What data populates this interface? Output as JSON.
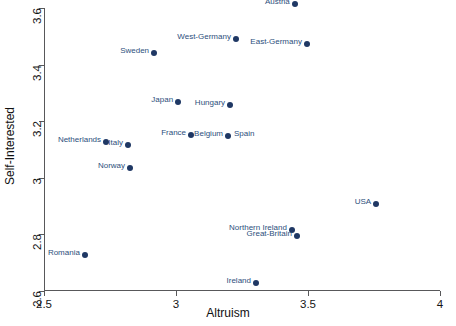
{
  "chart_data": {
    "type": "scatter",
    "title": "",
    "xlabel": "Altruism",
    "ylabel": "Self-Interested",
    "xlim": [
      2.5,
      4.0
    ],
    "ylim": [
      2.6,
      3.6
    ],
    "xticks": [
      "2.5",
      "3",
      "3.5",
      "4"
    ],
    "xtick_values": [
      2.5,
      3,
      3.5,
      4
    ],
    "yticks": [
      "2.6",
      "2.8",
      "3",
      "3.2",
      "3.4",
      "3.6"
    ],
    "ytick_values": [
      2.6,
      2.8,
      3.0,
      3.2,
      3.4,
      3.6
    ],
    "grid": false,
    "legend": null,
    "marker_color": "#1f3864",
    "label_color": "#2d4f7c",
    "points": [
      {
        "label": "Finland",
        "x": 3.155,
        "y": 3.639,
        "label_side": "left"
      },
      {
        "label": "Austria",
        "x": 3.45,
        "y": 3.613,
        "label_side": "left"
      },
      {
        "label": "West-Germany",
        "x": 3.227,
        "y": 3.489,
        "label_side": "left"
      },
      {
        "label": "East-Germany",
        "x": 3.496,
        "y": 3.473,
        "label_side": "left"
      },
      {
        "label": "Sweden",
        "x": 2.917,
        "y": 3.442,
        "label_side": "left"
      },
      {
        "label": "Japan",
        "x": 3.008,
        "y": 3.268,
        "label_side": "left"
      },
      {
        "label": "Hungary",
        "x": 3.205,
        "y": 3.256,
        "label_side": "left"
      },
      {
        "label": "France",
        "x": 3.057,
        "y": 3.151,
        "label_side": "left"
      },
      {
        "label": "Belgium",
        "x": 3.197,
        "y": 3.147,
        "label_side": "left"
      },
      {
        "label": "Spain",
        "x": 3.197,
        "y": 3.147,
        "label_side": "right"
      },
      {
        "label": "Netherlands",
        "x": 2.735,
        "y": 3.128,
        "label_side": "left"
      },
      {
        "label": "Italy",
        "x": 2.818,
        "y": 3.116,
        "label_side": "left"
      },
      {
        "label": "Norway",
        "x": 2.826,
        "y": 3.035,
        "label_side": "left"
      },
      {
        "label": "USA",
        "x": 3.758,
        "y": 2.907,
        "label_side": "left"
      },
      {
        "label": "Northern Ireland",
        "x": 3.439,
        "y": 2.814,
        "label_side": "left"
      },
      {
        "label": "Great-Britain",
        "x": 3.458,
        "y": 2.795,
        "label_side": "left"
      },
      {
        "label": "Romania",
        "x": 2.655,
        "y": 2.728,
        "label_side": "left"
      },
      {
        "label": "Ireland",
        "x": 3.303,
        "y": 2.63,
        "label_side": "left"
      }
    ]
  }
}
